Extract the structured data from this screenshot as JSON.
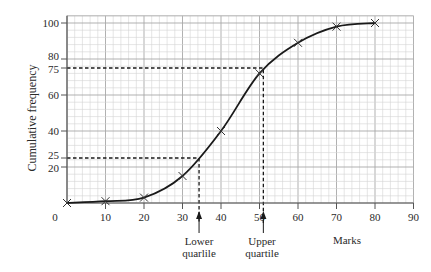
{
  "chart_data": {
    "type": "line",
    "title": "",
    "xlabel": "Marks",
    "ylabel": "Cumulative frequency",
    "x": [
      0,
      10,
      20,
      30,
      40,
      50,
      60,
      70,
      80
    ],
    "series": [
      {
        "name": "Cumulative frequency",
        "values": [
          0,
          1,
          3,
          15,
          40,
          72,
          89,
          98,
          100
        ],
        "marker": "x"
      }
    ],
    "xlim": [
      0,
      90
    ],
    "ylim": [
      0,
      104
    ],
    "x_ticks": [
      0,
      10,
      20,
      30,
      40,
      50,
      60,
      70,
      80,
      90
    ],
    "y_ticks": [
      20,
      25,
      40,
      60,
      75,
      80,
      100
    ],
    "grid": true,
    "grid_minor": {
      "x_step": 2,
      "y_step": 4
    },
    "annotations": [
      {
        "type": "dashed-guide",
        "y": 25,
        "x": 34.3,
        "label": "Lower quarlile"
      },
      {
        "type": "dashed-guide",
        "y": 75,
        "x": 51,
        "label": "Upper quartile"
      }
    ],
    "legend": "none"
  },
  "labels": {
    "ylabel": "Cumulative frequency",
    "xlabel": "Marks",
    "lower_line1": "Lower",
    "lower_line2": "quarlile",
    "upper_line1": "Upper",
    "upper_line2": "quartile"
  },
  "colors": {
    "grid_minor": "#d4d4d4",
    "grid_major": "#a8a8a8",
    "axis": "#555555",
    "curve": "#1a1a1a",
    "dashed": "#1a1a1a"
  }
}
